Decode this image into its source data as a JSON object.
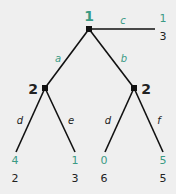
{
  "colors": {
    "player1": "#3a9a84",
    "player2": "#222222",
    "background": "#efefef"
  },
  "tree": {
    "root": {
      "player": "1"
    },
    "left_node": {
      "player": "2"
    },
    "right_node": {
      "player": "2"
    },
    "actions": {
      "a": "a",
      "b": "b",
      "c": "c",
      "left_d": "d",
      "e": "e",
      "right_d": "d",
      "f": "f"
    },
    "payoffs": {
      "c": {
        "p1": "1",
        "p2": "3"
      },
      "a_d": {
        "p1": "4",
        "p2": "2"
      },
      "a_e": {
        "p1": "1",
        "p2": "3"
      },
      "b_d": {
        "p1": "0",
        "p2": "6"
      },
      "b_f": {
        "p1": "5",
        "p2": "5"
      }
    }
  }
}
